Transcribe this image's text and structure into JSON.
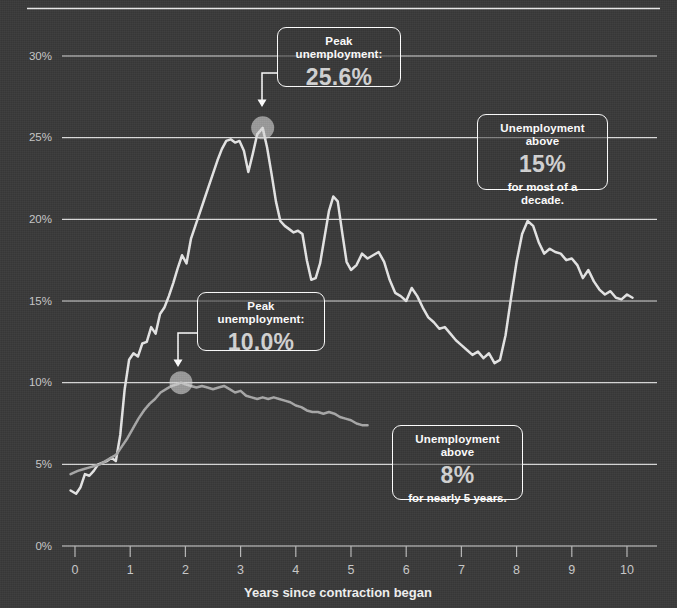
{
  "chart_data": {
    "type": "line",
    "title": "",
    "xlabel": "Years since contraction began",
    "ylabel": "",
    "xlim": [
      -0.3,
      10.6
    ],
    "ylim": [
      0,
      32
    ],
    "grid": true,
    "legend": "none",
    "y_ticks": [
      "0%",
      "5%",
      "10%",
      "15%",
      "20%",
      "25%",
      "30%"
    ],
    "y_tick_values": [
      0,
      5,
      10,
      15,
      20,
      25,
      30
    ],
    "x_ticks": [
      "0",
      "1",
      "2",
      "3",
      "4",
      "5",
      "6",
      "7",
      "8",
      "9",
      "10"
    ],
    "x_tick_values": [
      0,
      1,
      2,
      3,
      4,
      5,
      6,
      7,
      8,
      9,
      10
    ],
    "series": [
      {
        "name": "great-depression",
        "color": "#e6e6e6",
        "peak": {
          "x": 3.4,
          "y": 25.6
        },
        "x": [
          -0.08,
          0.02,
          0.1,
          0.18,
          0.26,
          0.34,
          0.42,
          0.5,
          0.58,
          0.66,
          0.74,
          0.82,
          0.9,
          0.98,
          1.06,
          1.14,
          1.22,
          1.3,
          1.38,
          1.46,
          1.54,
          1.62,
          1.7,
          1.78,
          1.86,
          1.94,
          2.02,
          2.1,
          2.18,
          2.26,
          2.34,
          2.42,
          2.5,
          2.58,
          2.66,
          2.74,
          2.82,
          2.9,
          2.98,
          3.06,
          3.14,
          3.22,
          3.3,
          3.4,
          3.48,
          3.56,
          3.64,
          3.72,
          3.8,
          3.88,
          3.96,
          4.04,
          4.12,
          4.2,
          4.28,
          4.36,
          4.44,
          4.52,
          4.6,
          4.68,
          4.76,
          4.84,
          4.92,
          5.0,
          5.1,
          5.2,
          5.3,
          5.4,
          5.5,
          5.6,
          5.7,
          5.8,
          5.9,
          6.0,
          6.1,
          6.2,
          6.3,
          6.4,
          6.5,
          6.6,
          6.7,
          6.8,
          6.9,
          7.0,
          7.1,
          7.2,
          7.3,
          7.4,
          7.5,
          7.6,
          7.7,
          7.8,
          7.9,
          8.0,
          8.1,
          8.2,
          8.3,
          8.4,
          8.5,
          8.6,
          8.7,
          8.8,
          8.9,
          9.0,
          9.1,
          9.2,
          9.3,
          9.4,
          9.5,
          9.6,
          9.7,
          9.8,
          9.9,
          10.0,
          10.1
        ],
        "y": [
          3.4,
          3.2,
          3.6,
          4.4,
          4.3,
          4.6,
          5.0,
          5.1,
          5.2,
          5.4,
          5.2,
          6.8,
          9.6,
          11.4,
          11.8,
          11.6,
          12.4,
          12.5,
          13.4,
          13.0,
          14.2,
          14.6,
          15.3,
          16.1,
          17.0,
          17.8,
          17.3,
          18.8,
          19.6,
          20.4,
          21.2,
          22.0,
          22.8,
          23.6,
          24.3,
          24.8,
          24.9,
          24.7,
          24.8,
          24.2,
          22.9,
          24.0,
          25.2,
          25.6,
          24.4,
          22.8,
          21.1,
          19.9,
          19.6,
          19.4,
          19.2,
          19.3,
          19.1,
          17.5,
          16.3,
          16.4,
          17.3,
          18.9,
          20.5,
          21.4,
          21.1,
          19.2,
          17.4,
          16.9,
          17.2,
          17.9,
          17.6,
          17.8,
          18.0,
          17.4,
          16.3,
          15.5,
          15.3,
          15.0,
          15.8,
          15.3,
          14.6,
          14.0,
          13.7,
          13.3,
          13.4,
          13.0,
          12.6,
          12.3,
          12.0,
          11.7,
          11.9,
          11.5,
          11.8,
          11.2,
          11.4,
          12.9,
          15.2,
          17.4,
          19.1,
          19.9,
          19.6,
          18.6,
          17.9,
          18.2,
          18.0,
          17.9,
          17.5,
          17.6,
          17.2,
          16.4,
          16.9,
          16.2,
          15.7,
          15.4,
          15.6,
          15.2,
          15.1,
          15.4,
          15.2
        ]
      },
      {
        "name": "great-recession",
        "color": "#a8a8a8",
        "peak": {
          "x": 1.92,
          "y": 10.0
        },
        "x": [
          -0.08,
          0.05,
          0.15,
          0.25,
          0.35,
          0.45,
          0.55,
          0.65,
          0.75,
          0.85,
          0.95,
          1.05,
          1.15,
          1.25,
          1.35,
          1.45,
          1.55,
          1.65,
          1.75,
          1.85,
          1.92,
          2.0,
          2.1,
          2.2,
          2.3,
          2.4,
          2.5,
          2.6,
          2.7,
          2.8,
          2.9,
          3.0,
          3.1,
          3.2,
          3.3,
          3.4,
          3.5,
          3.6,
          3.7,
          3.8,
          3.9,
          4.0,
          4.1,
          4.2,
          4.3,
          4.4,
          4.5,
          4.6,
          4.7,
          4.8,
          4.9,
          5.0,
          5.1,
          5.2,
          5.3
        ],
        "y": [
          4.4,
          4.6,
          4.7,
          4.8,
          4.9,
          5.0,
          5.2,
          5.4,
          5.6,
          6.1,
          6.6,
          7.2,
          7.8,
          8.3,
          8.7,
          9.0,
          9.4,
          9.6,
          9.8,
          9.9,
          10.0,
          9.9,
          9.8,
          9.7,
          9.8,
          9.7,
          9.6,
          9.7,
          9.8,
          9.6,
          9.4,
          9.5,
          9.2,
          9.1,
          9.0,
          9.1,
          9.0,
          9.1,
          9.0,
          8.9,
          8.8,
          8.6,
          8.5,
          8.3,
          8.2,
          8.2,
          8.1,
          8.2,
          8.1,
          7.9,
          7.8,
          7.7,
          7.5,
          7.4,
          7.4
        ]
      }
    ],
    "annotations": [
      {
        "id": "peak-depression",
        "top": "Peak unemployment:",
        "value": "25.6%",
        "bottom": "",
        "points_to": {
          "x": 3.4,
          "y": 25.6
        }
      },
      {
        "id": "above-15",
        "top": "Unemployment above",
        "value": "15%",
        "bottom": "for most of a decade."
      },
      {
        "id": "peak-recession",
        "top": "Peak unemployment:",
        "value": "10.0%",
        "bottom": "",
        "points_to": {
          "x": 1.92,
          "y": 10.0
        }
      },
      {
        "id": "above-8",
        "top": "Unemployment above",
        "value": "8%",
        "bottom": "for nearly 5 years."
      }
    ]
  },
  "colors": {
    "background": "#393939",
    "gridline": "#e8e8e8",
    "series_primary": "#e6e6e6",
    "series_secondary": "#a8a8a8",
    "text": "#ffffff",
    "value_text": "#d3d3d3",
    "marker": "#d6d6d6"
  }
}
